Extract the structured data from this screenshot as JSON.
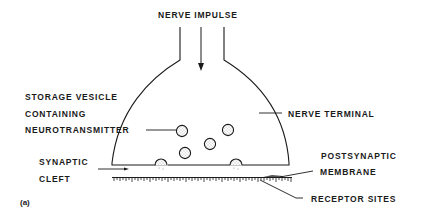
{
  "figure": {
    "panel_label": "(a)",
    "title": "NERVE IMPULSE",
    "labels": {
      "storage_vesicle_line1": "STORAGE VESICLE",
      "storage_vesicle_line2": "CONTAINING",
      "storage_vesicle_line3": "NEUROTRANSMITTER",
      "nerve_terminal": "NERVE TERMINAL",
      "synaptic_cleft_line1": "SYNAPTIC",
      "synaptic_cleft_line2": "CLEFT",
      "postsynaptic_line1": "POSTSYNAPTIC",
      "postsynaptic_line2": "MEMBRANE",
      "receptor_sites": "RECEPTOR SITES"
    },
    "colors": {
      "ink": "#1a1a1a",
      "background": "#ffffff"
    }
  }
}
